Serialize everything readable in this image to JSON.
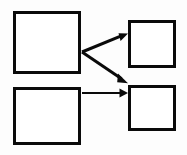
{
  "canvas": {
    "width": 187,
    "height": 155,
    "background_color": "#fdfdfd",
    "stroke_color": "#0a0a0a",
    "node_fill_color": "#ffffff"
  },
  "diagram": {
    "type": "block-diagram",
    "title": "",
    "nodes": [
      {
        "id": "node-top-left",
        "label": "",
        "x": 13,
        "y": 11,
        "width": 68,
        "height": 63,
        "border_width": 3
      },
      {
        "id": "node-top-right",
        "label": "",
        "x": 128,
        "y": 20,
        "width": 48,
        "height": 48,
        "border_width": 3
      },
      {
        "id": "node-bottom-left",
        "label": "",
        "x": 13,
        "y": 87,
        "width": 68,
        "height": 58,
        "border_width": 3
      },
      {
        "id": "node-bottom-right",
        "label": "",
        "x": 128,
        "y": 85,
        "width": 48,
        "height": 46,
        "border_width": 3
      }
    ],
    "edges": [
      {
        "id": "edge-topleft-to-topright",
        "label": "",
        "from": "node-top-left",
        "to": "node-top-right",
        "x1": 82,
        "y1": 52,
        "x2": 126,
        "y2": 34,
        "stroke_width": 3,
        "arrowhead": "filled-triangle",
        "arrow_size": 7
      },
      {
        "id": "edge-topleft-to-bottomright",
        "label": "",
        "from": "node-top-left",
        "to": "node-bottom-right",
        "x1": 82,
        "y1": 52,
        "x2": 126,
        "y2": 82,
        "stroke_width": 3,
        "arrowhead": "filled-triangle",
        "arrow_size": 7
      },
      {
        "id": "edge-bottomleft-to-bottomright",
        "label": "",
        "from": "node-bottom-left",
        "to": "node-bottom-right",
        "x1": 82,
        "y1": 93,
        "x2": 126,
        "y2": 93,
        "stroke_width": 2,
        "arrowhead": "filled-triangle",
        "arrow_size": 6
      }
    ]
  }
}
